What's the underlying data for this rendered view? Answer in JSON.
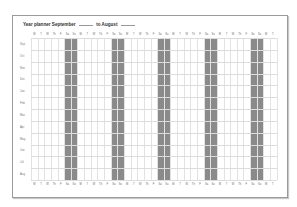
{
  "header": {
    "title_prefix": "Year planner September",
    "title_middle": "to August"
  },
  "days": [
    "M",
    "T",
    "W",
    "Th",
    "F",
    "Sa",
    "Su",
    "M",
    "T",
    "W",
    "Th",
    "F",
    "Sa",
    "Su",
    "M",
    "T",
    "W",
    "Th",
    "F",
    "Sa",
    "Su",
    "M",
    "T",
    "W",
    "Th",
    "F",
    "Sa",
    "Su",
    "M",
    "T",
    "W",
    "Th",
    "F",
    "Sa",
    "Su",
    "M",
    "T"
  ],
  "months": [
    "Sep",
    "Oct",
    "Nov",
    "Dec",
    "Jan",
    "Feb",
    "Mar",
    "Apr",
    "May",
    "Jun",
    "Jul",
    "Aug"
  ],
  "colors": {
    "weekend_shade": "#8a8a8a",
    "grid_line": "#e2e2e2",
    "border": "#9a9a9a"
  }
}
